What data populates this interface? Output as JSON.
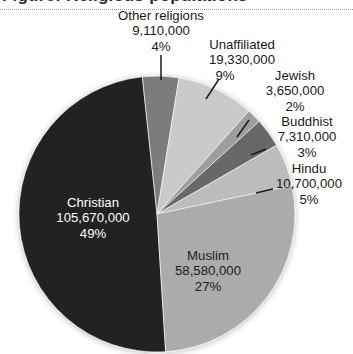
{
  "figure": {
    "cropped_heading": "Figure: Religious populations",
    "divider": "dotted-rule"
  },
  "chart_data": {
    "type": "pie",
    "title": "",
    "subtitle": "",
    "xlabel": "",
    "ylabel": "",
    "legend_position": "none",
    "grid": false,
    "labels_show": [
      "name",
      "value",
      "percent"
    ],
    "total": 214350000,
    "categories": [
      "Christian",
      "Other religions",
      "Unaffiliated",
      "Jewish",
      "Buddhist",
      "Hindu",
      "Muslim"
    ],
    "values": [
      105670000,
      9110000,
      19330000,
      3650000,
      7310000,
      10700000,
      58580000
    ],
    "percents": [
      49,
      4,
      9,
      2,
      3,
      5,
      27
    ],
    "value_labels": [
      "105,670,000",
      "9,110,000",
      "19,330,000",
      "3,650,000",
      "7,310,000",
      "10,700,000",
      "58,580,000"
    ],
    "percent_labels": [
      "49%",
      "4%",
      "9%",
      "2%",
      "3%",
      "5%",
      "27%"
    ],
    "colors": [
      "#232323",
      "#7c7c7c",
      "#c9c9c9",
      "#9d9d9d",
      "#676767",
      "#bcbcbc",
      "#ababab"
    ],
    "slices": [
      {
        "name": "Christian",
        "value_label": "105,670,000",
        "percent_label": "49%",
        "color": "#232323",
        "start_deg": 176.4,
        "sweep_deg": 177.5,
        "label_placement": "inside-light"
      },
      {
        "name": "Other religions",
        "value_label": "9,110,000",
        "percent_label": "4%",
        "color": "#7c7c7c",
        "start_deg": 353.9,
        "sweep_deg": 15.3,
        "label_placement": "outside-leader"
      },
      {
        "name": "Unaffiliated",
        "value_label": "19,330,000",
        "percent_label": "9%",
        "color": "#c9c9c9",
        "start_deg": 9.2,
        "sweep_deg": 32.5,
        "label_placement": "outside-leader"
      },
      {
        "name": "Jewish",
        "value_label": "3,650,000",
        "percent_label": "2%",
        "color": "#9d9d9d",
        "start_deg": 41.7,
        "sweep_deg": 6.1,
        "label_placement": "outside-leader"
      },
      {
        "name": "Buddhist",
        "value_label": "7,310,000",
        "percent_label": "3%",
        "color": "#676767",
        "start_deg": 47.8,
        "sweep_deg": 12.3,
        "label_placement": "outside-leader"
      },
      {
        "name": "Hindu",
        "value_label": "10,700,000",
        "percent_label": "5%",
        "color": "#bcbcbc",
        "start_deg": 60.1,
        "sweep_deg": 18.0,
        "label_placement": "outside-leader"
      },
      {
        "name": "Muslim",
        "value_label": "58,580,000",
        "percent_label": "27%",
        "color": "#ababab",
        "start_deg": 78.1,
        "sweep_deg": 98.3,
        "label_placement": "inside-dark"
      }
    ]
  },
  "labels": {
    "other_religions": {
      "name": "Other religions",
      "value": "9,110,000",
      "percent": "4%"
    },
    "unaffiliated": {
      "name": "Unaffiliated",
      "value": "19,330,000",
      "percent": "9%"
    },
    "jewish": {
      "name": "Jewish",
      "value": "3,650,000",
      "percent": "2%"
    },
    "buddhist": {
      "name": "Buddhist",
      "value": "7,310,000",
      "percent": "3%"
    },
    "hindu": {
      "name": "Hindu",
      "value": "10,700,000",
      "percent": "5%"
    },
    "christian": {
      "name": "Christian",
      "value": "105,670,000",
      "percent": "49%"
    },
    "muslim": {
      "name": "Muslim",
      "value": "58,580,000",
      "percent": "27%"
    }
  }
}
